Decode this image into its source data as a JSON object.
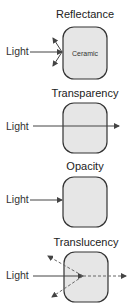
{
  "diagram": {
    "panels": [
      {
        "title": "Reflectance",
        "input_label": "Light",
        "material_label": "Ceramic",
        "behavior": "reflected"
      },
      {
        "title": "Transparency",
        "input_label": "Light",
        "behavior": "transmitted"
      },
      {
        "title": "Opacity",
        "input_label": "Light",
        "behavior": "absorbed"
      },
      {
        "title": "Translucency",
        "input_label": "Light",
        "behavior": "partially transmitted and scattered"
      }
    ],
    "colors": {
      "box_fill": "#e6e6e6",
      "box_stroke": "#333333",
      "arrow": "#444444"
    }
  }
}
